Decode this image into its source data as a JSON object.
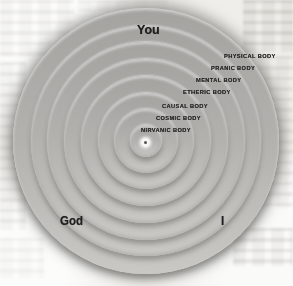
{
  "diagram": {
    "top_label": "You",
    "bottom_left_label": "God",
    "bottom_right_label": "I",
    "rings": [
      {
        "label": "PHYSICAL BODY",
        "radius": 133
      },
      {
        "label": "PRANIC BODY",
        "radius": 115
      },
      {
        "label": "MENTAL BODY",
        "radius": 99
      },
      {
        "label": "ETHERIC BODY",
        "radius": 82
      },
      {
        "label": "CAUSAL BODY",
        "radius": 65
      },
      {
        "label": "COSMIC BODY",
        "radius": 48
      },
      {
        "label": "NIRVANIC BODY",
        "radius": 32
      }
    ],
    "core": {
      "radius": 16
    },
    "colors": {
      "paper": "#efeeea",
      "ring_top": "#a4a3a0",
      "ring_mid": "#b2b1ae",
      "ring_bottom": "#c9c8c4",
      "label_text": "#2c2b29",
      "corner_text": "#1f1f1f",
      "center_dot_outer": "#f6f6f4",
      "center_dot_inner": "#57554f"
    }
  }
}
